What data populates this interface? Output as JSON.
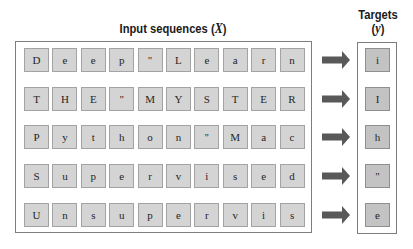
{
  "input_title": {
    "prefix": "Input sequences (",
    "var": "X",
    "suffix": ")"
  },
  "targets_title": {
    "line1": "Targets",
    "prefix": "(",
    "var": "y",
    "suffix": ")"
  },
  "colors": {
    "cell_fill": "#d4d4d4",
    "cell_border": "#a3a3a3",
    "target_fill": "#c3c3c3",
    "target_border": "#8f8f8f",
    "arrow": "#595959",
    "frame": "#7d7d7d"
  },
  "arrow_icon": "right-arrow-icon",
  "rows": [
    {
      "input": [
        "D",
        "e",
        "e",
        "p",
        "''",
        "L",
        "e",
        "a",
        "r",
        "n"
      ],
      "target": "i"
    },
    {
      "input": [
        "T",
        "H",
        "E",
        "''",
        "M",
        "Y",
        "S",
        "T",
        "E",
        "R"
      ],
      "target": "I"
    },
    {
      "input": [
        "P",
        "y",
        "t",
        "h",
        "o",
        "n",
        "''",
        "M",
        "a",
        "c"
      ],
      "target": "h"
    },
    {
      "input": [
        "S",
        "u",
        "p",
        "e",
        "r",
        "v",
        "i",
        "s",
        "e",
        "d"
      ],
      "target": "''"
    },
    {
      "input": [
        "U",
        "n",
        "s",
        "u",
        "p",
        "e",
        "r",
        "v",
        "i",
        "s"
      ],
      "target": "e"
    }
  ]
}
